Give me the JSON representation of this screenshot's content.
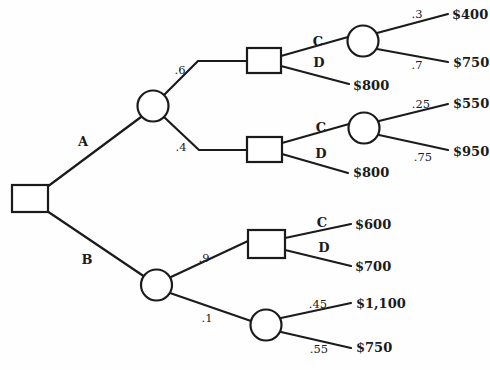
{
  "diagram": {
    "canvas": {
      "width": 490,
      "height": 370,
      "background": "#fefefe",
      "line_color": "#1b1b1b",
      "line_width": 2.2,
      "node_fill": "#ffffff"
    },
    "nodes": [
      {
        "id": "decision-root",
        "shape": "square",
        "x": 12,
        "y": 185,
        "w": 36,
        "h": 27
      },
      {
        "id": "chance-a",
        "shape": "circle",
        "cx": 153,
        "cy": 106,
        "r": 15.5
      },
      {
        "id": "chance-b",
        "shape": "circle",
        "cx": 156.5,
        "cy": 285,
        "r": 15.5
      },
      {
        "id": "decision-a-6",
        "shape": "square",
        "x": 247,
        "y": 48,
        "w": 34,
        "h": 25
      },
      {
        "id": "decision-a-4",
        "shape": "square",
        "x": 247,
        "y": 137,
        "w": 35,
        "h": 25
      },
      {
        "id": "chance-a-6-c",
        "shape": "circle",
        "cx": 363,
        "cy": 41,
        "r": 15.5
      },
      {
        "id": "chance-a-4-c",
        "shape": "circle",
        "cx": 364,
        "cy": 128,
        "r": 15.5
      },
      {
        "id": "decision-b-9",
        "shape": "square",
        "x": 248,
        "y": 230,
        "w": 37,
        "h": 28
      },
      {
        "id": "chance-b-1",
        "shape": "circle",
        "cx": 266,
        "cy": 325,
        "r": 15.5
      }
    ],
    "edges": [
      {
        "id": "branch-a",
        "points": [
          [
            47,
            187
          ],
          [
            141,
            117
          ]
        ],
        "label": "A",
        "kind": "letter",
        "lx": 83,
        "ly": 146
      },
      {
        "id": "branch-b",
        "points": [
          [
            47,
            211
          ],
          [
            145,
            277
          ]
        ],
        "label": "B",
        "kind": "letter",
        "lx": 87,
        "ly": 264
      },
      {
        "id": "branch-a-p6",
        "points": [
          [
            164,
            95
          ],
          [
            198,
            61
          ],
          [
            247,
            61
          ]
        ],
        "label": ".6",
        "kind": "prob",
        "lx": 180,
        "ly": 74
      },
      {
        "id": "branch-a-p4",
        "points": [
          [
            164,
            117
          ],
          [
            199,
            150
          ],
          [
            247,
            150
          ]
        ],
        "label": ".4",
        "kind": "prob",
        "lx": 181,
        "ly": 151
      },
      {
        "id": "branch-a6-c",
        "points": [
          [
            281,
            56
          ],
          [
            348,
            37
          ]
        ],
        "label": "C",
        "kind": "letter",
        "lx": 318,
        "ly": 46
      },
      {
        "id": "branch-a6-d",
        "points": [
          [
            281,
            66
          ],
          [
            349,
            84
          ]
        ],
        "label": "D",
        "kind": "letter",
        "lx": 319,
        "ly": 67
      },
      {
        "id": "branch-a6c-p3",
        "points": [
          [
            377,
            33
          ],
          [
            448,
            14
          ]
        ],
        "label": ".3",
        "kind": "prob",
        "lx": 417,
        "ly": 18
      },
      {
        "id": "branch-a6c-p7",
        "points": [
          [
            377,
            49
          ],
          [
            448,
            62
          ]
        ],
        "label": ".7",
        "kind": "prob",
        "lx": 417,
        "ly": 69
      },
      {
        "id": "branch-a4-c",
        "points": [
          [
            282,
            143
          ],
          [
            349,
            124
          ]
        ],
        "label": "C",
        "kind": "letter",
        "lx": 321,
        "ly": 132
      },
      {
        "id": "branch-a4-d",
        "points": [
          [
            282,
            154
          ],
          [
            348,
            173
          ]
        ],
        "label": "D",
        "kind": "letter",
        "lx": 321,
        "ly": 158
      },
      {
        "id": "branch-a4c-p25",
        "points": [
          [
            379,
            121
          ],
          [
            448,
            104
          ]
        ],
        "label": ".25",
        "kind": "prob",
        "lx": 421,
        "ly": 108
      },
      {
        "id": "branch-a4c-p75",
        "points": [
          [
            379,
            135
          ],
          [
            448,
            150
          ]
        ],
        "label": ".75",
        "kind": "prob",
        "lx": 423,
        "ly": 161
      },
      {
        "id": "branch-b-p9",
        "points": [
          [
            171,
            277
          ],
          [
            248,
            241
          ]
        ],
        "label": ".9",
        "kind": "prob",
        "lx": 204,
        "ly": 262
      },
      {
        "id": "branch-b-p1",
        "points": [
          [
            170,
            293
          ],
          [
            251,
            321
          ]
        ],
        "label": ".1",
        "kind": "prob",
        "lx": 207,
        "ly": 322
      },
      {
        "id": "branch-b9-c",
        "points": [
          [
            285,
            238
          ],
          [
            351,
            224
          ]
        ],
        "label": "C",
        "kind": "letter",
        "lx": 322,
        "ly": 227
      },
      {
        "id": "branch-b9-d",
        "points": [
          [
            285,
            250
          ],
          [
            351,
            266
          ]
        ],
        "label": "D",
        "kind": "letter",
        "lx": 324,
        "ly": 252
      },
      {
        "id": "branch-b1-p45",
        "points": [
          [
            281,
            318
          ],
          [
            351,
            303
          ]
        ],
        "label": ".45",
        "kind": "prob",
        "lx": 318,
        "ly": 308
      },
      {
        "id": "branch-b1-p55",
        "points": [
          [
            281,
            332
          ],
          [
            351,
            348
          ]
        ],
        "label": ".55",
        "kind": "prob",
        "lx": 319,
        "ly": 353
      }
    ],
    "terminals": [
      {
        "id": "payoff-400",
        "text": "$400",
        "x": 452,
        "y": 19
      },
      {
        "id": "payoff-750-a",
        "text": "$750",
        "x": 453,
        "y": 67
      },
      {
        "id": "payoff-800-a6",
        "text": "$800",
        "x": 353,
        "y": 90
      },
      {
        "id": "payoff-550",
        "text": "$550",
        "x": 453,
        "y": 108
      },
      {
        "id": "payoff-950",
        "text": "$950",
        "x": 453,
        "y": 156
      },
      {
        "id": "payoff-800-a4",
        "text": "$800",
        "x": 353,
        "y": 177
      },
      {
        "id": "payoff-600",
        "text": "$600",
        "x": 355,
        "y": 229
      },
      {
        "id": "payoff-700",
        "text": "$700",
        "x": 355,
        "y": 271
      },
      {
        "id": "payoff-1100",
        "text": "$1,100",
        "x": 356,
        "y": 308
      },
      {
        "id": "payoff-750-b",
        "text": "$750",
        "x": 356,
        "y": 352
      }
    ]
  }
}
